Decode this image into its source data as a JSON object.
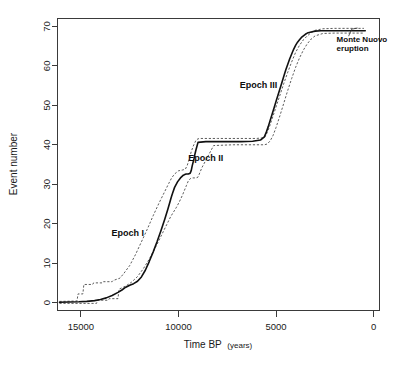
{
  "chart_data": {
    "type": "line",
    "title": "",
    "xlabel": "Time BP (years)",
    "ylabel": "Event number",
    "xlabel_main": "Time BP",
    "xlabel_unit": "(years)",
    "xlim": [
      16200,
      -300
    ],
    "ylim": [
      -2,
      72
    ],
    "x_reversed": true,
    "grid": false,
    "xticks": [
      15000,
      10000,
      5000,
      0
    ],
    "xtick_labels": [
      "15000",
      "10000",
      "5000",
      "0"
    ],
    "yticks": [
      0,
      10,
      20,
      30,
      40,
      50,
      60,
      70
    ],
    "ytick_labels": [
      "0",
      "10",
      "20",
      "30",
      "40",
      "50",
      "60",
      "70"
    ],
    "legend_position": "none",
    "series": [
      {
        "name": "Cumulative event number (best estimate)",
        "style": "solid",
        "color": "#111111",
        "x": [
          16100,
          15600,
          15100,
          14700,
          14300,
          14000,
          13700,
          13400,
          13100,
          12900,
          12700,
          12500,
          12300,
          12100,
          11900,
          11700,
          11500,
          11300,
          11100,
          10900,
          10700,
          10550,
          10450,
          10400,
          10350,
          10300,
          10200,
          10050,
          9900,
          9750,
          9650,
          9600,
          9500,
          9400,
          9350,
          9300,
          9200,
          9150,
          9100,
          9000,
          8600,
          8000,
          7400,
          6800,
          6200,
          5800,
          5600,
          5500,
          5400,
          5300,
          5200,
          5100,
          5000,
          4900,
          4800,
          4700,
          4600,
          4500,
          4400,
          4300,
          4200,
          4100,
          4000,
          3900,
          3800,
          3700,
          3600,
          3500,
          3400,
          3200,
          3000,
          2700,
          2400,
          2000,
          1500,
          1000,
          600,
          430
        ],
        "y": [
          0.1,
          0.15,
          0.2,
          0.3,
          0.5,
          0.8,
          1.2,
          1.8,
          2.6,
          3.2,
          3.9,
          4.4,
          4.8,
          5.4,
          6.5,
          8.2,
          10.4,
          12.8,
          15.4,
          18.2,
          21.2,
          23.6,
          25.3,
          26.2,
          27.0,
          27.8,
          29.2,
          30.6,
          31.6,
          32.3,
          32.5,
          32.6,
          32.6,
          32.8,
          33.4,
          34.6,
          36.6,
          37.8,
          38.8,
          40.6,
          40.8,
          40.8,
          40.8,
          40.8,
          40.9,
          41.2,
          42.0,
          43.2,
          44.6,
          46.2,
          47.8,
          49.4,
          51.0,
          52.6,
          54.2,
          55.8,
          57.4,
          59.0,
          60.4,
          61.8,
          63.0,
          64.2,
          65.2,
          66.0,
          66.6,
          67.2,
          67.6,
          68.0,
          68.3,
          68.6,
          68.8,
          68.9,
          68.9,
          68.9,
          68.9,
          68.9,
          68.9,
          68.9
        ]
      },
      {
        "name": "Upper confidence band",
        "style": "dashed",
        "color": "#4a4a4a",
        "x": [
          16100,
          15200,
          15150,
          14900,
          14850,
          14400,
          14350,
          13900,
          13850,
          13400,
          13350,
          13000,
          12800,
          12500,
          12200,
          11900,
          11600,
          11300,
          11000,
          10700,
          10500,
          10350,
          10200,
          10000,
          9800,
          9650,
          9550,
          9450,
          9350,
          9250,
          9100,
          9000,
          8900,
          8700,
          8000,
          7000,
          6000,
          5600,
          5500,
          5350,
          5200,
          5000,
          4800,
          4600,
          4400,
          4200,
          4000,
          3800,
          3600,
          3400,
          3200,
          3000,
          2600,
          2000,
          1200,
          500
        ],
        "y": [
          0.3,
          0.4,
          2.2,
          2.2,
          4.6,
          4.6,
          5.0,
          5.0,
          5.3,
          5.3,
          5.6,
          6.2,
          7.4,
          9.4,
          12.2,
          15.4,
          18.6,
          22.0,
          25.2,
          28.2,
          30.2,
          31.6,
          32.6,
          33.4,
          33.6,
          33.8,
          34.8,
          36.4,
          38.2,
          39.6,
          41.2,
          41.5,
          41.6,
          41.6,
          41.6,
          41.6,
          41.6,
          41.8,
          42.6,
          44.4,
          46.6,
          49.6,
          52.6,
          55.6,
          58.4,
          61.0,
          63.4,
          65.2,
          66.6,
          67.6,
          68.4,
          69.0,
          69.4,
          69.5,
          69.5,
          69.5
        ]
      },
      {
        "name": "Lower confidence band",
        "style": "dashed",
        "color": "#4a4a4a",
        "x": [
          16100,
          14200,
          14150,
          13600,
          13550,
          13100,
          13050,
          12700,
          12400,
          12100,
          11800,
          11500,
          11200,
          10900,
          10600,
          10400,
          10250,
          10100,
          9950,
          9800,
          9700,
          9600,
          9500,
          9400,
          9300,
          9200,
          9100,
          9000,
          8800,
          8200,
          7200,
          6200,
          5600,
          5450,
          5300,
          5150,
          5000,
          4800,
          4600,
          4400,
          4200,
          4000,
          3800,
          3600,
          3400,
          3200,
          3000,
          2600,
          2000,
          1200,
          500
        ],
        "y": [
          -0.2,
          -0.2,
          0.6,
          0.6,
          1.0,
          1.0,
          3.4,
          4.2,
          5.2,
          6.6,
          8.6,
          11.0,
          13.8,
          16.8,
          19.8,
          21.8,
          23.0,
          24.2,
          25.6,
          27.2,
          28.4,
          29.6,
          30.8,
          31.4,
          31.6,
          31.6,
          31.6,
          31.8,
          34.2,
          39.8,
          40.0,
          40.0,
          40.0,
          40.2,
          41.0,
          42.4,
          44.4,
          47.4,
          50.6,
          53.8,
          56.8,
          59.6,
          62.0,
          64.0,
          65.6,
          66.8,
          67.6,
          68.2,
          68.3,
          68.3,
          68.3
        ]
      }
    ],
    "annotations": [
      {
        "id": "epoch-1",
        "text": "Epoch I",
        "x": 12600,
        "y": 17.0
      },
      {
        "id": "epoch-2",
        "text": "Epoch II",
        "x": 8600,
        "y": 36.0
      },
      {
        "id": "epoch-3",
        "text": "Epoch III",
        "x": 5900,
        "y": 54.5
      },
      {
        "id": "monte-nuovo",
        "line1": "Monte Nuovo",
        "line2": "eruption",
        "x": 1900,
        "y": 66.0
      }
    ]
  },
  "figure": {
    "background_color": "#ffffff",
    "axis_color": "#3a3a3a",
    "curve_color": "#111111",
    "band_color": "#4a4a4a"
  }
}
